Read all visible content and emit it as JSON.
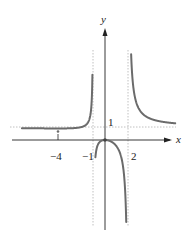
{
  "chart_data": {
    "type": "line",
    "title": "",
    "xlabel": "x",
    "ylabel": "y",
    "function": "f(x) = x^2 / ((x+1)(x-2))",
    "vertical_asymptotes": [
      -1,
      2
    ],
    "horizontal_asymptote": 1,
    "x_tick_labels": [
      "-4",
      "-1",
      "2"
    ],
    "y_tick_labels": [
      "1"
    ],
    "marked_points": [
      {
        "x": -4,
        "y": 0.89,
        "label": "local minimum"
      },
      {
        "x": 0,
        "y": 0,
        "label": "local maximum"
      }
    ],
    "series": [
      {
        "name": "f(x) left branch",
        "x": [
          -7,
          -6,
          -5,
          -4,
          -3,
          -2,
          -1.5,
          -1.2
        ],
        "y": [
          0.96,
          0.9,
          0.89,
          0.89,
          0.9,
          1.0,
          1.29,
          1.86
        ]
      },
      {
        "name": "f(x) middle branch",
        "x": [
          -0.9,
          -0.5,
          0,
          0.5,
          1,
          1.5,
          1.9
        ],
        "y": [
          -2.8,
          -0.2,
          0,
          -0.2,
          -0.5,
          -1.8,
          -12.3
        ]
      },
      {
        "name": "f(x) right branch",
        "x": [
          2.2,
          2.5,
          3,
          4,
          5,
          6
        ],
        "y": [
          7.6,
          3.6,
          2.25,
          1.6,
          1.39,
          1.29
        ]
      }
    ],
    "xlim": [
      -7.5,
      7.5
    ],
    "ylim": [
      -7,
      7
    ],
    "grid": false,
    "legend": "none"
  },
  "labels": {
    "x_axis": "x",
    "y_axis": "y",
    "tick_neg4": "−4",
    "tick_neg1": "−1",
    "tick_2": "2",
    "tick_y1": "1"
  },
  "colors": {
    "curve": "#6b6b6b",
    "axis": "#222222",
    "asymptote": "#aaaaaa"
  }
}
